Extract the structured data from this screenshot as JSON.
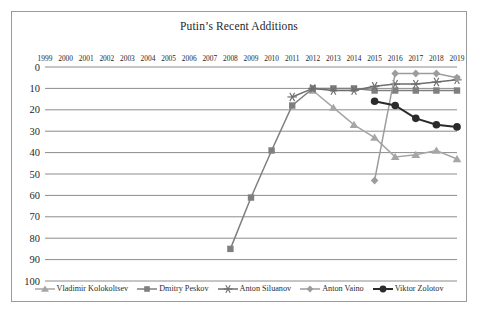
{
  "chart_data": {
    "type": "line",
    "title": "Putin’s Recent Additions",
    "xlabel": "",
    "ylabel": "",
    "x": [
      1999,
      2000,
      2001,
      2002,
      2003,
      2004,
      2005,
      2006,
      2007,
      2008,
      2009,
      2010,
      2011,
      2012,
      2013,
      2014,
      2015,
      2016,
      2017,
      2018,
      2019
    ],
    "xtick_labels": [
      "1999",
      "2000",
      "2001",
      "2002",
      "2003",
      "2004",
      "2005",
      "2006",
      "2007",
      "2008",
      "2009",
      "2010",
      "2011",
      "2012",
      "2013",
      "2014",
      "2015",
      "2016",
      "2017",
      "2018",
      "2019"
    ],
    "ytick_labels": [
      "0",
      "10",
      "20",
      "30",
      "40",
      "50",
      "60",
      "70",
      "80",
      "90",
      "100"
    ],
    "ylim": [
      0,
      100
    ],
    "y_inverted": true,
    "xaxis_position": "top",
    "grid": true,
    "grid_axis": "y",
    "legend_position": "bottom",
    "series": [
      {
        "name": "Vladimir Kolokoltsev",
        "marker": "triangle",
        "color": "#a6a6a6",
        "points": [
          {
            "x": 2012,
            "y": 11
          },
          {
            "x": 2013,
            "y": 19
          },
          {
            "x": 2014,
            "y": 27
          },
          {
            "x": 2015,
            "y": 33
          },
          {
            "x": 2016,
            "y": 42
          },
          {
            "x": 2017,
            "y": 41
          },
          {
            "x": 2018,
            "y": 39
          },
          {
            "x": 2019,
            "y": 43
          }
        ]
      },
      {
        "name": "Dmitry Peskov",
        "marker": "square",
        "color": "#7f7f7f",
        "points": [
          {
            "x": 2008,
            "y": 85
          },
          {
            "x": 2009,
            "y": 61
          },
          {
            "x": 2010,
            "y": 39
          },
          {
            "x": 2011,
            "y": 18
          },
          {
            "x": 2012,
            "y": 10
          },
          {
            "x": 2013,
            "y": 10
          },
          {
            "x": 2014,
            "y": 10
          },
          {
            "x": 2015,
            "y": 11
          },
          {
            "x": 2016,
            "y": 11
          },
          {
            "x": 2017,
            "y": 11
          },
          {
            "x": 2018,
            "y": 11
          },
          {
            "x": 2019,
            "y": 11
          }
        ]
      },
      {
        "name": "Anton Siluanov",
        "marker": "asterisk",
        "color": "#6e6e6e",
        "points": [
          {
            "x": 2011,
            "y": 14
          },
          {
            "x": 2012,
            "y": 10
          },
          {
            "x": 2013,
            "y": 11
          },
          {
            "x": 2014,
            "y": 11
          },
          {
            "x": 2015,
            "y": 9
          },
          {
            "x": 2016,
            "y": 8
          },
          {
            "x": 2017,
            "y": 8
          },
          {
            "x": 2018,
            "y": 7
          },
          {
            "x": 2019,
            "y": 6
          }
        ]
      },
      {
        "name": "Anton Vaino",
        "marker": "diamond",
        "color": "#9c9c9c",
        "points": [
          {
            "x": 2015,
            "y": 53
          },
          {
            "x": 2016,
            "y": 3
          },
          {
            "x": 2017,
            "y": 3
          },
          {
            "x": 2018,
            "y": 3
          },
          {
            "x": 2019,
            "y": 5
          }
        ]
      },
      {
        "name": "Viktor Zolotov",
        "marker": "circle",
        "color": "#2b2b2b",
        "points": [
          {
            "x": 2015,
            "y": 16
          },
          {
            "x": 2016,
            "y": 18
          },
          {
            "x": 2017,
            "y": 24
          },
          {
            "x": 2018,
            "y": 27
          },
          {
            "x": 2019,
            "y": 28
          }
        ]
      }
    ]
  },
  "legend": [
    {
      "label": "Vladimir Kolokoltsev"
    },
    {
      "label": "Dmitry Peskov"
    },
    {
      "label": "Anton Siluanov"
    },
    {
      "label": "Anton Vaino"
    },
    {
      "label": "Viktor Zolotov"
    }
  ],
  "colors": {
    "grid": "#8c8c8c",
    "border": "#9a9a9a",
    "background": "#ffffff",
    "text": "#1f1f1f"
  }
}
